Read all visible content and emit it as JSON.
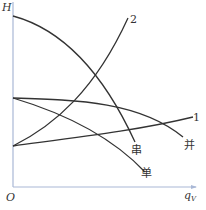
{
  "axes": {
    "y_label": "H",
    "x_label_main": "q",
    "x_label_sub": "V",
    "origin_label": "O",
    "axis_color": "#a9b8d6"
  },
  "curves": [
    {
      "id": "series",
      "label": "串",
      "description": "series pump curve"
    },
    {
      "id": "system2",
      "label": "2",
      "description": "system curve 2"
    },
    {
      "id": "single",
      "label": "单",
      "description": "single pump curve"
    },
    {
      "id": "parallel",
      "label": "并",
      "description": "parallel pump curve"
    },
    {
      "id": "system1",
      "label": "1",
      "description": "system curve 1"
    }
  ],
  "line_color": "#333333"
}
